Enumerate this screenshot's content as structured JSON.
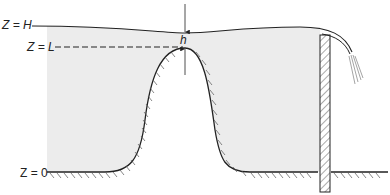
{
  "figure": {
    "type": "hydraulics diagram: flow over a hump with a downstream weir/gate",
    "labels": {
      "z_h": "Z = H",
      "z_l": "Z = L",
      "z_0": "Z = 0",
      "h": "h"
    },
    "colors": {
      "line": "#222222",
      "water_fill": "#ececec",
      "hatch": "#555555",
      "background": "#ffffff"
    },
    "elements": [
      "free-surface",
      "reference-level-L-dashed",
      "hump",
      "channel-floor",
      "weir-plate",
      "overflow-nappe",
      "depth-arrow-h"
    ]
  }
}
